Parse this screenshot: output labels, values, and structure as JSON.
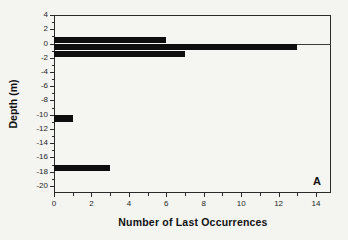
{
  "figure": {
    "background_color": "#f4f4f1",
    "bar_color": "#0e0e0e",
    "axis_color": "#2b2b2b"
  },
  "chart_data": {
    "type": "bar",
    "orientation": "horizontal",
    "title": "",
    "xlabel": "Number of Last Occurrences",
    "ylabel": "Depth (m)",
    "panel_label": "A",
    "xlim": [
      0,
      14.8
    ],
    "ylim": [
      -21,
      4
    ],
    "x_ticks": [
      0,
      2,
      4,
      6,
      8,
      10,
      12,
      14
    ],
    "x_minor_ticks": [
      1,
      3,
      5,
      7,
      9,
      11,
      13
    ],
    "y_ticks": [
      4,
      2,
      0,
      -2,
      -4,
      -6,
      -8,
      -10,
      -12,
      -14,
      -16,
      -18,
      -20
    ],
    "y_minor_ticks": [
      3,
      1,
      -1,
      -3,
      -5,
      -7,
      -9,
      -11,
      -13,
      -15,
      -17,
      -19
    ],
    "zero_line": true,
    "grid": false,
    "legend": false,
    "bars": [
      {
        "depth_center": 0.5,
        "depth_interval": [
          1,
          0
        ],
        "value": 6
      },
      {
        "depth_center": -0.5,
        "depth_interval": [
          0,
          -1
        ],
        "value": 13
      },
      {
        "depth_center": -1.5,
        "depth_interval": [
          -1,
          -2
        ],
        "value": 7
      },
      {
        "depth_center": -10.5,
        "depth_interval": [
          -10,
          -11
        ],
        "value": 1
      },
      {
        "depth_center": -17.5,
        "depth_interval": [
          -17,
          -18
        ],
        "value": 3
      }
    ]
  }
}
